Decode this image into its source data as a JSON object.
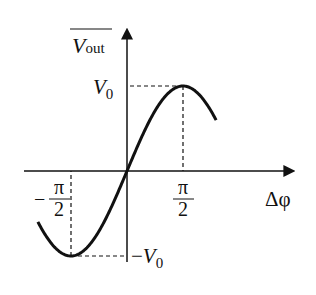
{
  "chart_data": {
    "type": "line",
    "title": "",
    "xlabel": "Δφ",
    "ylabel": "V_out (mean)",
    "function": "V0 · sin(Δφ)",
    "x_range": [
      -2.5,
      2.5
    ],
    "y_range": [
      -1,
      1
    ],
    "x_ticks": [
      {
        "value": -1.5708,
        "label_num": "π",
        "label_den": "2",
        "sign": "−"
      },
      {
        "value": 1.5708,
        "label_num": "π",
        "label_den": "2",
        "sign": ""
      }
    ],
    "y_ticks": [
      {
        "value": 1,
        "label": "V",
        "sub": "0",
        "sign": ""
      },
      {
        "value": -1,
        "label": "V",
        "sub": "0",
        "sign": "−"
      }
    ],
    "series": [
      {
        "name": "V_out",
        "color": "#111111"
      }
    ],
    "grid": false
  },
  "labels": {
    "y_axis_main": "V",
    "y_axis_sub": "out",
    "x_axis": "Δφ"
  }
}
